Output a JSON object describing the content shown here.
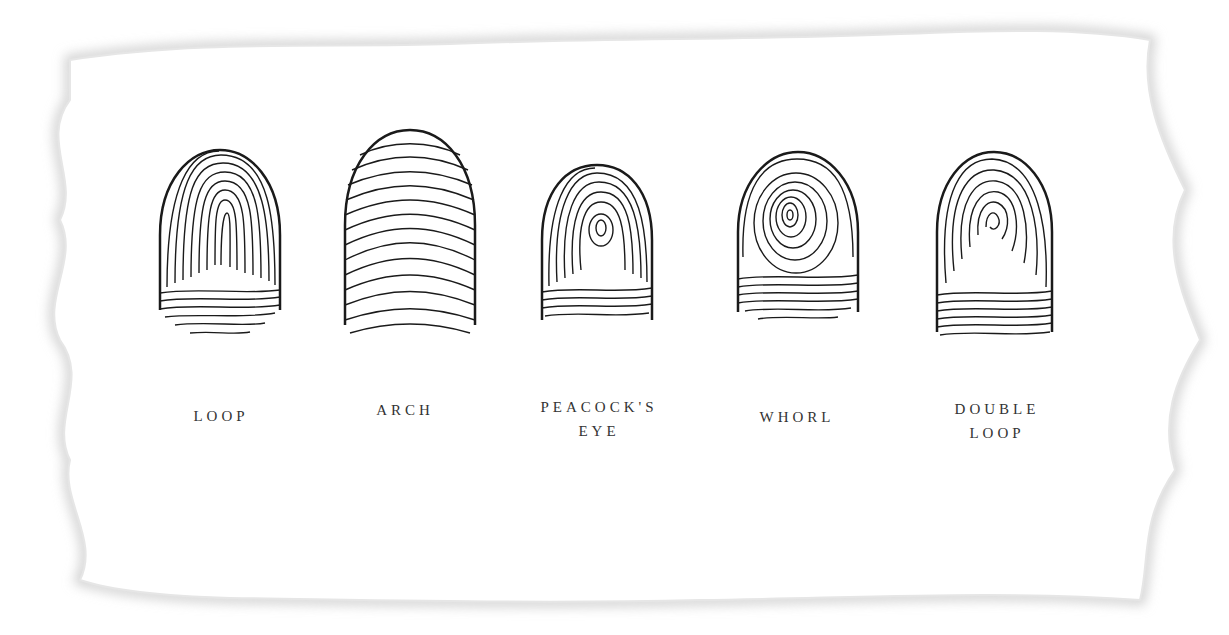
{
  "diagram": {
    "colors": {
      "ink": "#1a1a1a",
      "label": "#333333",
      "paper_edge": "#d6d6d6",
      "background": "#ffffff"
    },
    "prints": [
      {
        "id": "loop",
        "label_lines": [
          "LOOP"
        ],
        "pattern": "loop"
      },
      {
        "id": "arch",
        "label_lines": [
          "ARCH"
        ],
        "pattern": "arch"
      },
      {
        "id": "peacocks-eye",
        "label_lines": [
          "PEACOCK'S",
          "EYE"
        ],
        "pattern": "peacocks-eye"
      },
      {
        "id": "whorl",
        "label_lines": [
          "WHORL"
        ],
        "pattern": "whorl"
      },
      {
        "id": "double-loop",
        "label_lines": [
          "DOUBLE",
          "LOOP"
        ],
        "pattern": "double-loop"
      }
    ]
  }
}
